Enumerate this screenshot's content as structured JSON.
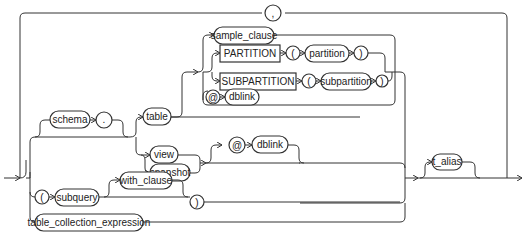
{
  "diagram": {
    "type": "railroad-syntax-diagram",
    "loop_separator": ",",
    "nodes": {
      "comma": ",",
      "schema": "schema",
      "dot": ".",
      "table": "table",
      "view": "view",
      "snapshot": "snapshot",
      "sample_clause": "sample_clause",
      "partition_kw": "PARTITION",
      "partition_lparen": "(",
      "partition": "partition",
      "partition_rparen": ")",
      "subpartition_kw": "SUBPARTITION",
      "subpartition_lparen": "(",
      "subpartition": "subpartition",
      "subpartition_rparen": ")",
      "at_sign_1": "@",
      "dblink_1": "dblink",
      "at_sign_2": "@",
      "dblink_2": "dblink",
      "subquery_lparen": "(",
      "subquery": "subquery",
      "with_clause": "with_clause",
      "subquery_rparen": ")",
      "table_collection_expression": "table_collection_expression",
      "t_alias": "t_alias"
    }
  }
}
